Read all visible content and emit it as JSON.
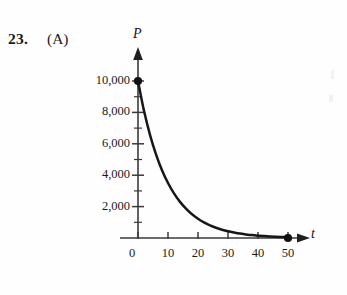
{
  "question": {
    "number": "23.",
    "choice": "(A)"
  },
  "chart_data": {
    "type": "line",
    "title": "",
    "subtitle": "",
    "xlabel": "t",
    "ylabel": "P",
    "xlim": [
      0,
      53
    ],
    "ylim": [
      0,
      10600
    ],
    "grid": false,
    "legend": null,
    "x_ticks": [
      0,
      10,
      20,
      30,
      40,
      50
    ],
    "x_tick_labels": [
      "0",
      "10",
      "20",
      "30",
      "40",
      "50"
    ],
    "x_minor_step": 10,
    "y_ticks": [
      2000,
      4000,
      6000,
      8000,
      10000
    ],
    "y_tick_labels": [
      "2,000",
      "4,000",
      "6,000",
      "8,000",
      "10,000"
    ],
    "y_minor_ticks": [
      1000,
      2000,
      3000,
      4000,
      5000,
      6000,
      7000,
      8000,
      9000,
      10000
    ],
    "series": [
      {
        "name": "P(t)",
        "x": [
          0,
          2,
          4,
          6,
          8,
          10,
          12,
          14,
          16,
          18,
          20,
          22,
          24,
          26,
          28,
          30,
          32,
          34,
          36,
          38,
          40,
          42,
          44,
          46,
          48,
          50
        ],
        "values": [
          10000,
          8100,
          6570,
          5330,
          4320,
          3500,
          2840,
          2300,
          1870,
          1510,
          1230,
          995,
          805,
          655,
          530,
          430,
          350,
          280,
          230,
          185,
          150,
          122,
          99,
          80,
          65,
          50
        ]
      }
    ],
    "markers": [
      {
        "label": "start-point",
        "x": 0,
        "y": 10000
      },
      {
        "label": "end-point",
        "x": 50,
        "y": 0
      }
    ]
  }
}
